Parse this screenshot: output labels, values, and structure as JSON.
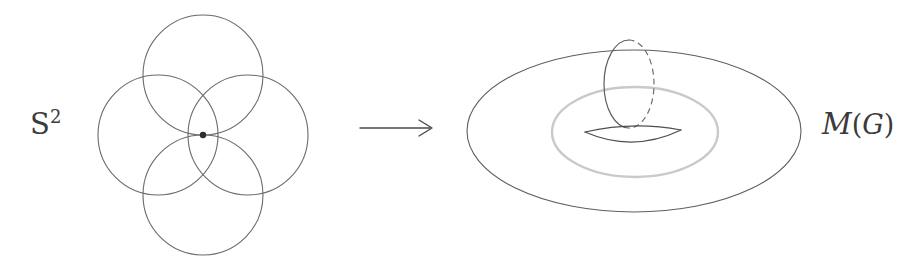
{
  "figure": {
    "background_color": "#ffffff",
    "width": 920,
    "height": 268
  },
  "labels": {
    "source": {
      "text": "S",
      "superscript": "2",
      "full_text": "S^2",
      "meaning": "blackboard-bold-S-squared",
      "color": "#3b3b3b",
      "x": 30,
      "y": 108
    },
    "target": {
      "text": "M",
      "open_paren": "(",
      "group": "G",
      "close_paren": ")",
      "full_text": "M(G)",
      "meaning": "script-M-of-G",
      "color": "#3b3b3b",
      "x": 822,
      "y": 110
    }
  },
  "arrow": {
    "name": "map-arrow",
    "direction": "right",
    "x_start": 360,
    "x_end": 432,
    "y": 128,
    "color": "#4a4a4a",
    "stroke_width": 1.4
  },
  "wedge_of_circles": {
    "name": "bouquet-of-four-circles",
    "count": 4,
    "basepoint": {
      "x": 203,
      "y": 135,
      "radius": 3.2,
      "color": "#2e2e2e"
    },
    "stroke_color": "#6a6a6a",
    "stroke_width": 1.1,
    "circles": [
      {
        "id": "top-circle",
        "cx": 203,
        "cy": 75,
        "r": 60
      },
      {
        "id": "left-circle",
        "cx": 158,
        "cy": 135,
        "r": 60
      },
      {
        "id": "right-circle",
        "cx": 248,
        "cy": 135,
        "r": 60
      },
      {
        "id": "bottom-circle",
        "cx": 203,
        "cy": 195,
        "r": 60
      }
    ]
  },
  "torus": {
    "name": "torus-surface",
    "outer_ellipse": {
      "cx": 634,
      "cy": 131,
      "rx": 167,
      "ry": 81,
      "stroke": "#5e5e5e",
      "stroke_width": 1.1
    },
    "inner_hole_ellipse": {
      "cx": 635,
      "cy": 132,
      "rx": 83,
      "ry": 45,
      "stroke": "#c9c9c9",
      "stroke_width": 2.4
    },
    "meridian_loop": {
      "cx": 629,
      "cy": 84,
      "rx": 25,
      "ry": 44,
      "solid_half": "left",
      "dashed_half": "right",
      "stroke": "#5e5e5e",
      "stroke_width": 1.2,
      "dash_pattern": "5,5"
    },
    "lens_shape": {
      "name": "handle-lens",
      "left_x": 585,
      "right_x": 681,
      "mid_y": 137,
      "top_bulge": 10,
      "bottom_bulge": 12,
      "stroke": "#4f4f4f",
      "stroke_width": 1.2
    }
  }
}
